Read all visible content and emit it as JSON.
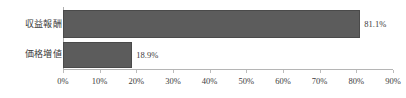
{
  "chart_data": {
    "type": "bar",
    "orientation": "horizontal",
    "title": "",
    "subtitle": "",
    "xlabel": "",
    "ylabel": "",
    "categories": [
      "収益報酬",
      "価格増値"
    ],
    "values": [
      81.1,
      18.9
    ],
    "value_labels": [
      "81.1%",
      "18.9%"
    ],
    "xlim": [
      0,
      90
    ],
    "xticks": [
      0,
      10,
      20,
      30,
      40,
      50,
      60,
      70,
      80,
      90
    ],
    "xtick_labels": [
      "0%",
      "10%",
      "20%",
      "30%",
      "40%",
      "50%",
      "60%",
      "70%",
      "80%",
      "90%"
    ],
    "grid": false,
    "legend": false,
    "legend_position": "none",
    "series": [
      {
        "name": "",
        "values": [
          81.1,
          18.9
        ]
      }
    ],
    "colors": {
      "bar_fill": "#5c5c5c",
      "bar_border": "#4a4a4a",
      "axis_line": "#b5b5b5",
      "tick": "#bcbcbc",
      "text": "#3c3c3c",
      "category_text": "#3a3a3a",
      "background": "#ffffff"
    }
  }
}
